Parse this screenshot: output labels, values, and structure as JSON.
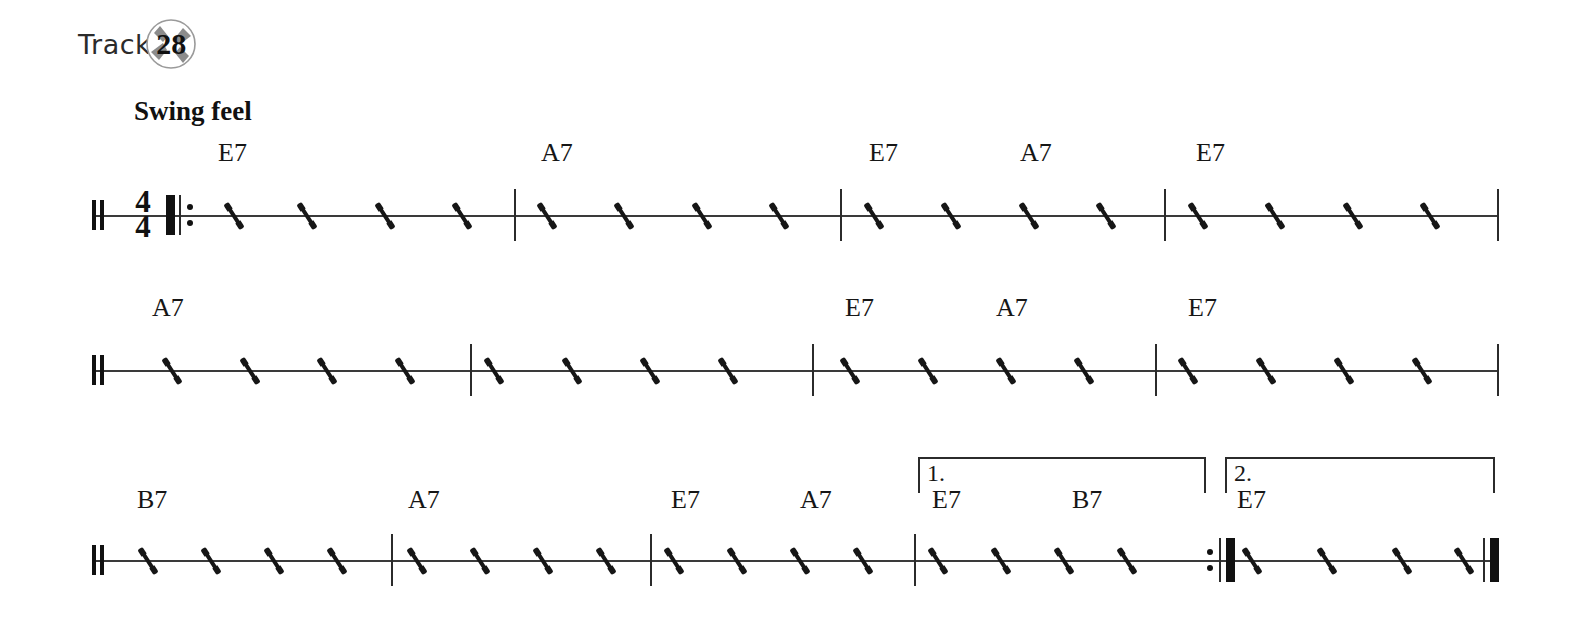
{
  "track": {
    "label": "Track",
    "number": "28",
    "icon": "compact-disc-icon"
  },
  "tempo_marking": "Swing feel",
  "time_signature": {
    "numerator": "4",
    "denominator": "4"
  },
  "systems": [
    {
      "id": "system-1",
      "top": 215,
      "staff_left": 92,
      "staff_right": 1497,
      "start_barline": "double-thin",
      "has_time_signature": true,
      "start_repeat": true,
      "end_barline": "single",
      "barlines": [
        514,
        840,
        1164
      ],
      "slashes": [
        232,
        305,
        383,
        460,
        545,
        622,
        700,
        777,
        872,
        949,
        1027,
        1104,
        1196,
        1273,
        1351,
        1428
      ],
      "chords": [
        {
          "text": "E7",
          "x": 218,
          "y": 140
        },
        {
          "text": "A7",
          "x": 541,
          "y": 140
        },
        {
          "text": "E7",
          "x": 869,
          "y": 140
        },
        {
          "text": "A7",
          "x": 1020,
          "y": 140
        },
        {
          "text": "E7",
          "x": 1196,
          "y": 140
        }
      ]
    },
    {
      "id": "system-2",
      "top": 370,
      "staff_left": 92,
      "staff_right": 1497,
      "start_barline": "double-thin",
      "has_time_signature": false,
      "start_repeat": false,
      "end_barline": "single",
      "barlines": [
        470,
        812,
        1155
      ],
      "slashes": [
        170,
        248,
        325,
        403,
        492,
        570,
        648,
        726,
        848,
        926,
        1004,
        1082,
        1186,
        1264,
        1342,
        1420
      ],
      "chords": [
        {
          "text": "A7",
          "x": 152,
          "y": 295
        },
        {
          "text": "E7",
          "x": 845,
          "y": 295
        },
        {
          "text": "A7",
          "x": 996,
          "y": 295
        },
        {
          "text": "E7",
          "x": 1188,
          "y": 295
        }
      ]
    },
    {
      "id": "system-3",
      "top": 560,
      "staff_left": 92,
      "staff_right": 1497,
      "start_barline": "double-thin",
      "has_time_signature": false,
      "start_repeat": false,
      "end_barline": "final",
      "barlines": [
        391,
        650,
        914
      ],
      "end_repeat_x": 1207,
      "slashes": [
        146,
        209,
        272,
        335,
        415,
        478,
        541,
        604,
        672,
        735,
        798,
        861,
        936,
        999,
        1062,
        1125,
        1250,
        1325,
        1400,
        1462
      ],
      "chords": [
        {
          "text": "B7",
          "x": 137,
          "y": 487
        },
        {
          "text": "A7",
          "x": 408,
          "y": 487
        },
        {
          "text": "E7",
          "x": 671,
          "y": 487
        },
        {
          "text": "A7",
          "x": 800,
          "y": 487
        },
        {
          "text": "E7",
          "x": 932,
          "y": 487
        },
        {
          "text": "B7",
          "x": 1072,
          "y": 487
        },
        {
          "text": "E7",
          "x": 1237,
          "y": 487
        }
      ]
    }
  ],
  "voltas": [
    {
      "id": "volta-1",
      "number": "1.",
      "x": 918,
      "y": 457,
      "width": 288,
      "height": 36,
      "close_right": true
    },
    {
      "id": "volta-2",
      "number": "2.",
      "x": 1225,
      "y": 457,
      "width": 270,
      "height": 36,
      "close_right": true
    }
  ],
  "colors": {
    "ink": "#161616",
    "staff": "#3a3a3a",
    "disc_gray": "#8a8a8a",
    "paper": "#ffffff"
  }
}
